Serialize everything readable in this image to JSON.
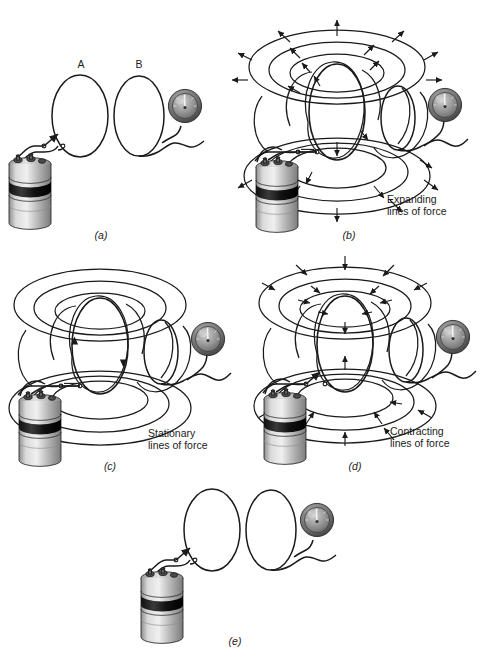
{
  "figure": {
    "title_alt": "Electromagnetic induction between coil A and coil B",
    "background": "#ffffff",
    "ink": "#1a1a1a"
  },
  "labels": {
    "coil_a": "A",
    "coil_b": "B"
  },
  "panels": [
    {
      "id": "a",
      "label": "(a)",
      "caption": "",
      "field_state": "none",
      "switch_state": "open",
      "components": [
        "battery",
        "switch",
        "coil-a",
        "coil-b",
        "galvanometer"
      ]
    },
    {
      "id": "b",
      "label": "(b)",
      "caption": "Expanding\nlines of force",
      "caption_line1": "Expanding",
      "caption_line2": "lines of force",
      "field_state": "expanding",
      "arrow_direction": "outward",
      "switch_state": "closing",
      "components": [
        "battery",
        "switch",
        "coil-a",
        "coil-b",
        "galvanometer",
        "field-lines"
      ]
    },
    {
      "id": "c",
      "label": "(c)",
      "caption": "Stationary\nlines of force",
      "caption_line1": "Stationary",
      "caption_line2": "lines of force",
      "field_state": "stationary",
      "arrow_direction": "none",
      "switch_state": "closed",
      "components": [
        "battery",
        "switch",
        "coil-a",
        "coil-b",
        "galvanometer",
        "field-lines"
      ]
    },
    {
      "id": "d",
      "label": "(d)",
      "caption": "Contracting\nlines of force",
      "caption_line1": "Contracting",
      "caption_line2": "lines of force",
      "field_state": "contracting",
      "arrow_direction": "inward",
      "switch_state": "opening",
      "components": [
        "battery",
        "switch",
        "coil-a",
        "coil-b",
        "galvanometer",
        "field-lines"
      ]
    },
    {
      "id": "e",
      "label": "(e)",
      "caption": "",
      "field_state": "none",
      "switch_state": "open",
      "components": [
        "battery",
        "switch",
        "coil-a",
        "coil-b",
        "galvanometer"
      ]
    }
  ],
  "icons": {
    "battery": "battery-cell-icon",
    "galvanometer": "galvanometer-icon",
    "switch": "knife-switch-icon",
    "coil": "wire-loop-icon",
    "field_arrow": "field-direction-arrow-icon"
  },
  "colors": {
    "ink": "#1a1a1a",
    "battery_body_light": "#d8d8d8",
    "battery_body_mid": "#9a9a9a",
    "battery_band_dark": "#1c1c1c",
    "meter_face": "#8d8d8d",
    "meter_rim": "#4a4a4a",
    "background": "#ffffff"
  }
}
